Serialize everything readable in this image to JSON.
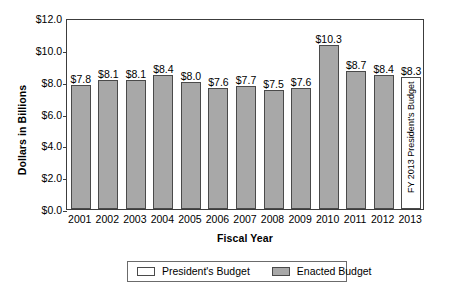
{
  "chart_data": {
    "type": "bar",
    "title": "",
    "xlabel": "Fiscal Year",
    "ylabel": "Dollars in Billions",
    "categories": [
      "2001",
      "2002",
      "2003",
      "2004",
      "2005",
      "2006",
      "2007",
      "2008",
      "2009",
      "2010",
      "2011",
      "2012",
      "2013"
    ],
    "values": [
      7.8,
      8.1,
      8.1,
      8.4,
      8.0,
      7.6,
      7.7,
      7.5,
      7.6,
      10.3,
      8.7,
      8.4,
      8.3
    ],
    "data_labels": [
      "$7.8",
      "$8.1",
      "$8.1",
      "$8.4",
      "$8.0",
      "$7.6",
      "$7.7",
      "$7.5",
      "$7.6",
      "$10.3",
      "$8.7",
      "$8.4",
      "$8.3"
    ],
    "series_of_bar": [
      "Enacted Budget",
      "Enacted Budget",
      "Enacted Budget",
      "Enacted Budget",
      "Enacted Budget",
      "Enacted Budget",
      "Enacted Budget",
      "Enacted Budget",
      "Enacted Budget",
      "Enacted Budget",
      "Enacted Budget",
      "Enacted Budget",
      "President's Budget"
    ],
    "ylim": [
      0.0,
      12.0
    ],
    "ytick_values": [
      0.0,
      2.0,
      4.0,
      6.0,
      8.0,
      10.0,
      12.0
    ],
    "ytick_labels": [
      "$0.0",
      "$2.0",
      "$4.0",
      "$6.0",
      "$8.0",
      "$10.0",
      "$12.0"
    ],
    "grid": false,
    "legend_position": "bottom-center",
    "legend": [
      {
        "label": "President's Budget",
        "swatch": "president"
      },
      {
        "label": "Enacted Budget",
        "swatch": "enacted"
      }
    ],
    "annotations": [
      {
        "text": "FY 2013 President's Budget",
        "category": "2013",
        "orientation": "vertical"
      }
    ],
    "colors": {
      "enacted_fill": "#a8a8a8",
      "president_fill": "#ffffff",
      "bar_border": "#4a4a4a",
      "axis": "#3c3c3c",
      "text": "#000000"
    }
  }
}
